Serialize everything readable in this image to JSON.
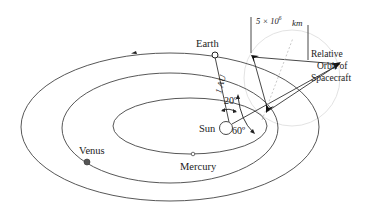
{
  "diagram": {
    "type": "orbital-geometry",
    "labels": {
      "earth": "Earth",
      "sun": "Sun",
      "venus": "Venus",
      "mercury": "Mercury",
      "distance": "1 AU",
      "angle_small": "20º",
      "angle_large": "60º",
      "scale_base": "5 × 10",
      "scale_exp": "6",
      "scale_unit": "km",
      "relative_line1": "Relative",
      "relative_line2": "Orbit of",
      "relative_line3": "Spacecraft"
    },
    "colors": {
      "stroke": "#333333",
      "faint": "#d8d8d8",
      "planet_venus": "#555555",
      "background": "#ffffff"
    },
    "bodies": [
      {
        "name": "Sun",
        "x": 226,
        "y": 128
      },
      {
        "name": "Earth",
        "x": 215,
        "y": 55
      },
      {
        "name": "Venus",
        "x": 87,
        "y": 162
      },
      {
        "name": "Mercury",
        "x": 193,
        "y": 154
      }
    ]
  }
}
